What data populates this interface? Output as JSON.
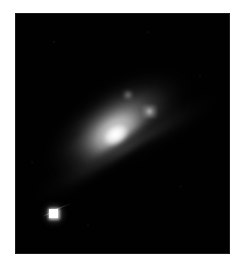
{
  "image": {
    "kind": "astronomical-photograph",
    "subject": "inclined spiral galaxy with bright nucleus and foreground point source",
    "color_mode": "grayscale",
    "background_color": "#010101",
    "frame_color": "#ffffff",
    "peak_color": "#ffffff",
    "plate": {
      "left": 15,
      "top": 13,
      "width": 215,
      "height": 241
    },
    "features": [
      {
        "name": "galaxy-nucleus",
        "label": "Bright galactic nucleus",
        "center_x": 112,
        "center_y": 133,
        "brightness": "saturated white"
      },
      {
        "name": "galaxy-disk",
        "label": "Inclined spiral disk",
        "position_angle_deg": -34,
        "brightness": "bright to faint gradient"
      },
      {
        "name": "dust-lane",
        "label": "Dark dust lane across lower disk",
        "position_angle_deg": -31,
        "brightness": "dark absorption band"
      },
      {
        "name": "outer-arm",
        "label": "Faint outer spiral arm toward lower left",
        "position_angle_deg": -29,
        "brightness": "very faint"
      },
      {
        "name": "point-source",
        "label": "Bright stellar point source with diffraction spike",
        "center_x": 52,
        "center_y": 212,
        "brightness": "saturated white"
      },
      {
        "name": "hii-knot",
        "label": "Bright knot in outer disk",
        "center_x": 148,
        "center_y": 112,
        "brightness": "moderate"
      }
    ]
  }
}
